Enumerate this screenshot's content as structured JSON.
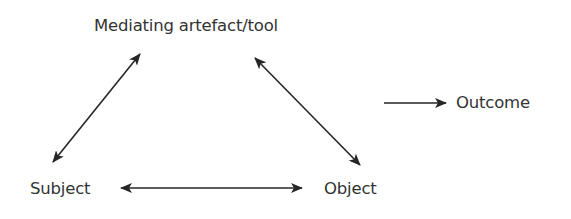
{
  "diagram": {
    "nodes": {
      "tool": {
        "label": "Mediating artefact/tool"
      },
      "subject": {
        "label": "Subject"
      },
      "object": {
        "label": "Object"
      },
      "outcome": {
        "label": "Outcome"
      }
    },
    "edges": [
      {
        "from": "subject",
        "to": "tool",
        "type": "bidirectional"
      },
      {
        "from": "tool",
        "to": "object",
        "type": "bidirectional"
      },
      {
        "from": "subject",
        "to": "object",
        "type": "bidirectional"
      },
      {
        "from": "object",
        "to": "outcome",
        "type": "unidirectional"
      }
    ],
    "colors": {
      "stroke": "#262626",
      "text": "#333333",
      "background": "#ffffff"
    }
  }
}
